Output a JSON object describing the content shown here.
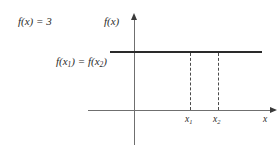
{
  "figure": {
    "type": "constant-function-diagram",
    "background_color": "#ffffff",
    "line_color": "#2a2a2a",
    "axis_color": "#6f6f6f",
    "dash_color": "#4a4a4a",
    "text_color": "#2b2b2b"
  },
  "labels": {
    "function_definition": "f(x) = 3",
    "y_axis": "f(x)",
    "x_axis": "x",
    "function_value": "f(x₁) = f(x₂)",
    "function_value_parts": {
      "lead": "f(x",
      "sub1": "1",
      "middle": ") = f(x",
      "sub2": "2",
      "tail": ")"
    },
    "tick_x1": {
      "base": "x",
      "sub": "1"
    },
    "tick_x2": {
      "base": "x",
      "sub": "2"
    }
  },
  "chart_data": {
    "type": "line",
    "title": "",
    "subtitle": "",
    "xlabel": "x",
    "ylabel": "f(x)",
    "grid": false,
    "legend_position": "none",
    "constant_value": 3,
    "series": [
      {
        "name": "f(x) = 3",
        "kind": "horizontal-constant-line",
        "y": 3,
        "x_start": -0.8,
        "x_end": 7.0,
        "values": [
          3,
          3
        ]
      }
    ],
    "annotations": [
      {
        "name": "function-definition",
        "text": "f(x) = 3",
        "position": "top-left"
      },
      {
        "name": "equal-outputs",
        "text": "f(x₁) = f(x₂)",
        "position": "left-of-line-below"
      },
      {
        "name": "dropline-x1",
        "text": "x₁",
        "x": 3.0,
        "from_y": 3,
        "to_y": 0,
        "style": "dashed"
      },
      {
        "name": "dropline-x2",
        "text": "x₂",
        "x": 4.2,
        "from_y": 3,
        "to_y": 0,
        "style": "dashed"
      }
    ],
    "xticks": [
      "x₁",
      "x₂"
    ],
    "xtick_values": [
      3.0,
      4.2
    ],
    "yticks": [],
    "xlim": [
      -1.9,
      7.7
    ],
    "ylim": [
      -1.5,
      4.5
    ],
    "axis_arrows": {
      "x": "right",
      "y": "up"
    }
  }
}
